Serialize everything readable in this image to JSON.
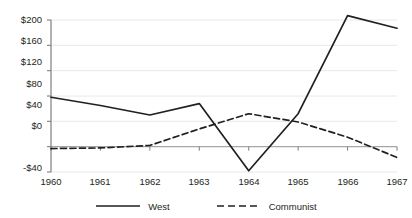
{
  "chart_data": {
    "type": "line",
    "title": "",
    "xlabel": "",
    "ylabel": "",
    "categories": [
      "1960",
      "1961",
      "1962",
      "1963",
      "1964",
      "1965",
      "1966",
      "1967"
    ],
    "x": [
      1960,
      1961,
      1962,
      1963,
      1964,
      1965,
      1966,
      1967
    ],
    "series": [
      {
        "name": "West",
        "style": "solid",
        "color": "#231f20",
        "values": [
          78,
          65,
          50,
          68,
          -38,
          52,
          207,
          187
        ]
      },
      {
        "name": "Communist",
        "style": "dashed",
        "color": "#231f20",
        "values": [
          -3,
          -2,
          2,
          28,
          52,
          39,
          15,
          -17
        ]
      }
    ],
    "ylim": [
      -40,
      200
    ],
    "xlim": [
      1960,
      1967
    ],
    "yticks": [
      -40,
      0,
      40,
      80,
      120,
      160,
      200
    ],
    "ytick_labels": [
      "-$40",
      "$0",
      "$40",
      "$80",
      "$120",
      "$160",
      "$200"
    ],
    "xtick_labels": [
      "1960",
      "1961",
      "1962",
      "1963",
      "1964",
      "1965",
      "1966",
      "1967"
    ],
    "grid": true,
    "grid_color": "#e8e8e8",
    "axis_color": "#7f7f7f",
    "zero_line_color": "#a6a6a6",
    "legend_position": "bottom",
    "legend": [
      {
        "label": "West",
        "style": "solid"
      },
      {
        "label": "Communist",
        "style": "dashed"
      }
    ],
    "background": "#ffffff"
  },
  "axis": {
    "y_labels": [
      "$200",
      "$160",
      "$120",
      "$80",
      "$40",
      "$0",
      "-$40"
    ],
    "x_labels": [
      "1960",
      "1961",
      "1962",
      "1963",
      "1964",
      "1965",
      "1966",
      "1967"
    ]
  },
  "legend": {
    "west_label": "West",
    "communist_label": "Communist"
  }
}
